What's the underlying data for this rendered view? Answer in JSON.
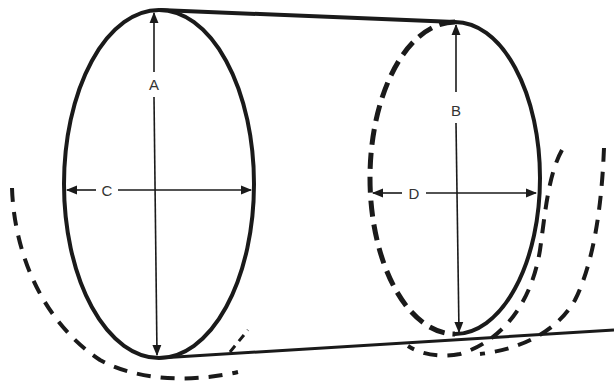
{
  "diagram": {
    "type": "cylinder-dimension-diagram",
    "stroke_color": "#1a1a1a",
    "background": "#ffffff",
    "labels": {
      "A": "A",
      "B": "B",
      "C": "C",
      "D": "D"
    },
    "dimensions": [
      {
        "label": "A",
        "description": "vertical height of left end ellipse"
      },
      {
        "label": "B",
        "description": "vertical height of right end ellipse"
      },
      {
        "label": "C",
        "description": "horizontal width of left end ellipse"
      },
      {
        "label": "D",
        "description": "horizontal width of right end ellipse"
      }
    ]
  }
}
